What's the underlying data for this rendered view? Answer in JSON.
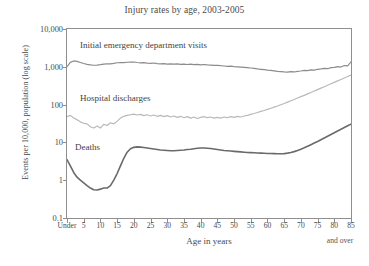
{
  "chart_data": {
    "type": "line",
    "title": "Injury rates by age, 2003-2005",
    "xlabel": "Age in years",
    "ylabel": "Events per 10,000, population (log scale)",
    "yscale": "log",
    "ylim": [
      0.1,
      10000
    ],
    "ytick_labels": [
      "10,000",
      "1,000",
      "100",
      "10",
      "1",
      "0.1"
    ],
    "ytick_values": [
      10000,
      1000,
      100,
      10,
      1,
      0.1
    ],
    "xlim": [
      0,
      85
    ],
    "xtick_labels": [
      "Under",
      "5",
      "10",
      "15",
      "20",
      "25",
      "30",
      "35",
      "40",
      "45",
      "50",
      "55",
      "60",
      "65",
      "70",
      "75",
      "80",
      "85"
    ],
    "xtick_values": [
      0,
      5,
      10,
      15,
      20,
      25,
      30,
      35,
      40,
      45,
      50,
      55,
      60,
      65,
      70,
      75,
      80,
      85
    ],
    "x_axis_note": "and over",
    "grid": false,
    "legend_position": "inline-labels",
    "colors": {
      "emergency_visits": "#8c8c8c",
      "hospital_discharges": "#b9b9b9",
      "deaths": "#6a6a6a",
      "axis": "#8f8f8f",
      "text": "#4a4a4a"
    },
    "x": [
      0,
      1,
      2,
      3,
      4,
      5,
      6,
      7,
      8,
      9,
      10,
      11,
      12,
      13,
      14,
      15,
      16,
      17,
      18,
      19,
      20,
      21,
      22,
      23,
      24,
      25,
      26,
      27,
      28,
      29,
      30,
      31,
      32,
      33,
      34,
      35,
      36,
      37,
      38,
      39,
      40,
      41,
      42,
      43,
      44,
      45,
      46,
      47,
      48,
      49,
      50,
      51,
      52,
      53,
      54,
      55,
      56,
      57,
      58,
      59,
      60,
      61,
      62,
      63,
      64,
      65,
      66,
      67,
      68,
      69,
      70,
      71,
      72,
      73,
      74,
      75,
      76,
      77,
      78,
      79,
      80,
      81,
      82,
      83,
      84,
      85
    ],
    "series": [
      {
        "name": "Initial emergency department visits",
        "label": "Initial emergency department visits",
        "color": "#8c8c8c",
        "values": [
          1010,
          1310,
          1430,
          1390,
          1300,
          1220,
          1160,
          1120,
          1100,
          1110,
          1140,
          1180,
          1200,
          1190,
          1230,
          1280,
          1300,
          1290,
          1320,
          1330,
          1340,
          1300,
          1270,
          1290,
          1250,
          1230,
          1260,
          1220,
          1200,
          1220,
          1180,
          1200,
          1170,
          1190,
          1160,
          1180,
          1150,
          1170,
          1140,
          1160,
          1130,
          1150,
          1120,
          1110,
          1090,
          1100,
          1070,
          1050,
          1030,
          1040,
          1010,
          1000,
          985,
          965,
          950,
          930,
          905,
          880,
          860,
          840,
          815,
          800,
          780,
          760,
          745,
          730,
          720,
          745,
          730,
          760,
          775,
          800,
          790,
          830,
          815,
          860,
          880,
          910,
          890,
          950,
          970,
          1010,
          985,
          1080,
          1060,
          1350
        ]
      },
      {
        "name": "Hospital discharges",
        "label": "Hospital discharges",
        "color": "#b9b9b9",
        "values": [
          48,
          52,
          44,
          40,
          35,
          32,
          31,
          26,
          24,
          27,
          24,
          30,
          28,
          33,
          31,
          36,
          44,
          49,
          52,
          54,
          56,
          53,
          55,
          51,
          54,
          50,
          53,
          49,
          52,
          48,
          51,
          47,
          50,
          46,
          49,
          45,
          48,
          44,
          47,
          43,
          46,
          48,
          45,
          47,
          44,
          46,
          44,
          47,
          45,
          48,
          46,
          49,
          47,
          50,
          52,
          55,
          58,
          62,
          66,
          70,
          75,
          80,
          86,
          92,
          99,
          107,
          116,
          126,
          137,
          149,
          162,
          176,
          192,
          209,
          228,
          249,
          272,
          297,
          325,
          355,
          388,
          424,
          463,
          506,
          553,
          605
        ]
      },
      {
        "name": "Deaths",
        "label": "Deaths",
        "color": "#6a6a6a",
        "values": [
          3.5,
          2.4,
          1.6,
          1.2,
          1.0,
          0.85,
          0.72,
          0.62,
          0.56,
          0.55,
          0.58,
          0.62,
          0.62,
          0.72,
          1.0,
          1.5,
          2.4,
          3.8,
          5.5,
          6.8,
          7.4,
          7.6,
          7.5,
          7.3,
          7.1,
          6.9,
          6.7,
          6.5,
          6.3,
          6.2,
          6.1,
          6.0,
          6.0,
          6.1,
          6.2,
          6.3,
          6.5,
          6.6,
          6.8,
          7.0,
          7.1,
          7.1,
          7.0,
          6.9,
          6.7,
          6.5,
          6.3,
          6.1,
          6.0,
          5.9,
          5.8,
          5.7,
          5.6,
          5.5,
          5.4,
          5.35,
          5.3,
          5.25,
          5.2,
          5.15,
          5.1,
          5.1,
          5.05,
          5.0,
          5.0,
          5.05,
          5.2,
          5.4,
          5.7,
          6.1,
          6.6,
          7.2,
          7.9,
          8.7,
          9.6,
          10.6,
          11.8,
          13.1,
          14.6,
          16.2,
          18.0,
          20.0,
          22.2,
          24.7,
          27.5,
          30.5
        ]
      }
    ]
  }
}
